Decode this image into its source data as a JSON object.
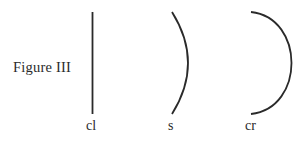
{
  "figure": {
    "title": "Figure III",
    "shapes": [
      {
        "id": "cl",
        "label": "cl",
        "type": "straight-line"
      },
      {
        "id": "s",
        "label": "s",
        "type": "shallow-arc"
      },
      {
        "id": "cr",
        "label": "cr",
        "type": "deep-arc"
      }
    ],
    "stroke_color": "#2a2a2a"
  }
}
